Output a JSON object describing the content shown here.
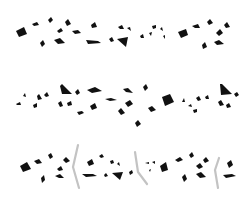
{
  "image": {
    "width": 249,
    "height": 223,
    "background": "#ffffff",
    "shard_color": "#111111",
    "stroke_color": "#b8b8b8"
  },
  "bands": [
    {
      "name": "band-1",
      "shards": [
        "16,31 24,27 27,34 19,37",
        "32,24 37,22 39,25 34,26",
        "48,20 51,17 53,20 50,23",
        "57,31 61,28 63,31 59,33",
        "65,22 68,19 71,24 67,26",
        "72,31 78,30 81,33 75,34",
        "54,40 60,38 65,43 58,44",
        "40,43 43,40 45,44 42,47",
        "91,25 95,22 97,27 92,28",
        "86,40 98,41 101,43 88,44",
        "109,39 112,37 114,41 111,42",
        "117,39 128,37 126,47",
        "118,27 122,25 124,29 120,29",
        "127,28 130,27 131,31",
        "140,36 143,34 144,38 141,38",
        "149,33 152,32 151,36",
        "152,26 156,25 156,28 153,29",
        "160,29 162,27 163,31",
        "163,36 165,35 165,39",
        "178,32 186,29 188,35 181,38",
        "192,26 198,24 200,28 195,28",
        "207,22 210,19 213,23 209,25",
        "216,33 220,29 223,33 219,36",
        "224,25 227,22 230,27 226,28",
        "202,45 205,42 207,47 203,49",
        "214,42 219,40 224,44 217,45"
      ]
    },
    {
      "name": "band-2",
      "shards": [
        "23,96 25,93 26,97",
        "16,104 20,102 21,105 17,105",
        "37,96 39,94 42,99 38,100",
        "44,95 47,92 49,96 46,97",
        "33,105 37,103 37,107 34,108",
        "60,86 62,84 72,94 62,94",
        "75,92 78,89 80,93 77,95",
        "87,90 95,87 102,91 92,93",
        "58,103 61,101 63,106 60,107",
        "67,103 71,101 72,105 68,106",
        "77,112 82,111 84,113 79,115",
        "90,106 95,103 97,108 92,110",
        "105,99 111,98 117,100 110,101",
        "123,89 128,88 133,93 126,92",
        "143,87 146,84 148,88 145,91",
        "125,103 130,100 133,104 128,107",
        "118,111 121,108 125,113 121,115",
        "135,123 138,120 141,124 137,127",
        "148,108 152,106 156,110 151,112",
        "162,97 170,94 174,102 165,106",
        "182,102 184,98 185,102",
        "188,106 191,104 192,107",
        "196,98 199,96 201,100 198,101",
        "205,97 208,95 209,99 206,99",
        "193,110 197,109 197,112 194,113",
        "220,84 222,84 232,94 221,95",
        "234,94 237,92 239,95 236,97",
        "218,102 221,100 224,105 220,106",
        "226,105 229,103 231,107 227,108"
      ]
    },
    {
      "name": "band-3",
      "shards": [
        "20,166 27,162 31,169 23,172",
        "34,161 39,159 42,163 37,164",
        "48,155 51,153 53,157 50,159",
        "57,169 61,166 63,170 59,171",
        "63,160 66,157 70,161 66,163",
        "55,176 60,174 64,178 59,178",
        "41,178 44,175 45,180 42,183",
        "87,162 92,159 94,164 89,166",
        "99,156 102,154 104,157 101,158",
        "82,174 93,174 97,176 86,177",
        "104,175 106,173 108,176 105,177",
        "110,161 113,160 114,163 111,164",
        "117,164 119,162 120,166",
        "112,173 123,172 120,180",
        "129,172 132,170 133,173 130,175",
        "145,163 149,162 149,164",
        "152,162 155,161 155,164",
        "149,170 151,169 150,172",
        "160,166 166,162 168,170 162,172",
        "175,160 180,157 183,160 178,162",
        "189,155 192,152 194,156 191,158",
        "196,166 200,163 203,167 199,169",
        "203,160 206,157 209,161 205,163",
        "182,177 185,174 187,179 184,182",
        "196,174 201,172 206,177 200,178",
        "227,163 231,160 233,165 229,168",
        "223,175 232,174 236,176 226,178"
      ],
      "chevrons": [
        "78,145 73,167 79,188",
        "135,152 138,172 147,184",
        "219,158 215,170 218,188"
      ]
    }
  ]
}
